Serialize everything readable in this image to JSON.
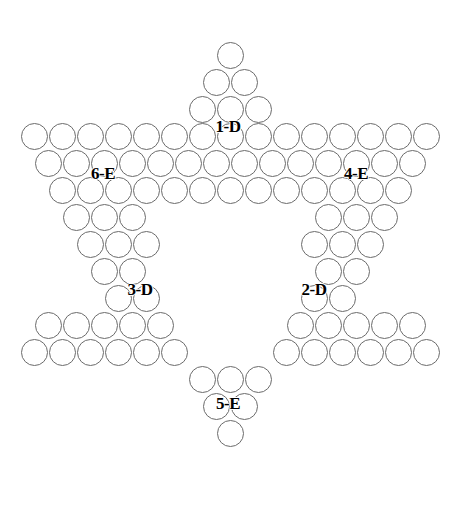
{
  "diagram": {
    "geometry": {
      "cell_dx": 28.0,
      "cell_dy": 27.0,
      "hole_diameter": 27,
      "origin_x": 34.0,
      "origin_y": 55.0,
      "stroke_color": "#6b6b6b",
      "stroke_width": 1.6,
      "background": "#ffffff",
      "label_color": "#000000",
      "label_font_size": 17
    },
    "rows": [
      {
        "index": 0,
        "count": 1,
        "start_col": 7.0
      },
      {
        "index": 1,
        "count": 2,
        "start_col": 6.5
      },
      {
        "index": 2,
        "count": 3,
        "start_col": 6.0
      },
      {
        "index": 3,
        "count": 15,
        "start_col": 0.0
      },
      {
        "index": 4,
        "count": 14,
        "start_col": 0.5
      },
      {
        "index": 5,
        "count": 13,
        "start_col": 1.0
      },
      {
        "index": 6,
        "count": 12,
        "start_col": 1.5
      },
      {
        "index": 7,
        "count": 11,
        "start_col": 2.0
      },
      {
        "index": 8,
        "count": 10,
        "start_col": 2.5
      },
      {
        "index": 9,
        "count": 9,
        "start_col": 3.0
      },
      {
        "index": 10,
        "count": 14,
        "start_col": 0.5
      },
      {
        "index": 11,
        "count": 15,
        "start_col": 0.0
      },
      {
        "index": 12,
        "count": 3,
        "start_col": 6.0
      },
      {
        "index": 13,
        "count": 2,
        "start_col": 6.5
      },
      {
        "index": 14,
        "count": 1,
        "start_col": 7.0
      }
    ],
    "hollow_rows": [
      {
        "index": 6,
        "keep_left": 3,
        "keep_right": 3
      },
      {
        "index": 7,
        "keep_left": 3,
        "keep_right": 3
      },
      {
        "index": 8,
        "keep_left": 2,
        "keep_right": 2
      },
      {
        "index": 9,
        "keep_left": 2,
        "keep_right": 2
      },
      {
        "index": 10,
        "keep_left": 5,
        "keep_right": 5
      },
      {
        "index": 11,
        "keep_left": 6,
        "keep_right": 6
      }
    ],
    "labels": [
      {
        "id": "label-1-d",
        "text": "1-D",
        "x": 228,
        "y": 127
      },
      {
        "id": "label-6-e",
        "text": "6-E",
        "x": 103,
        "y": 174
      },
      {
        "id": "label-4-e",
        "text": "4-E",
        "x": 356,
        "y": 174
      },
      {
        "id": "label-3-d",
        "text": "3-D",
        "x": 140,
        "y": 290
      },
      {
        "id": "label-2-d",
        "text": "2-D",
        "x": 314,
        "y": 290
      },
      {
        "id": "label-5-e",
        "text": "5-E",
        "x": 228,
        "y": 404
      }
    ]
  }
}
